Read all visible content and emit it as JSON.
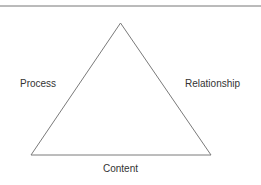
{
  "diagram": {
    "type": "triangle",
    "labels": {
      "left": "Process",
      "right": "Relationship",
      "bottom": "Content"
    },
    "colors": {
      "line": "#7a7a7a",
      "text": "#333333",
      "background": "#ffffff"
    }
  }
}
